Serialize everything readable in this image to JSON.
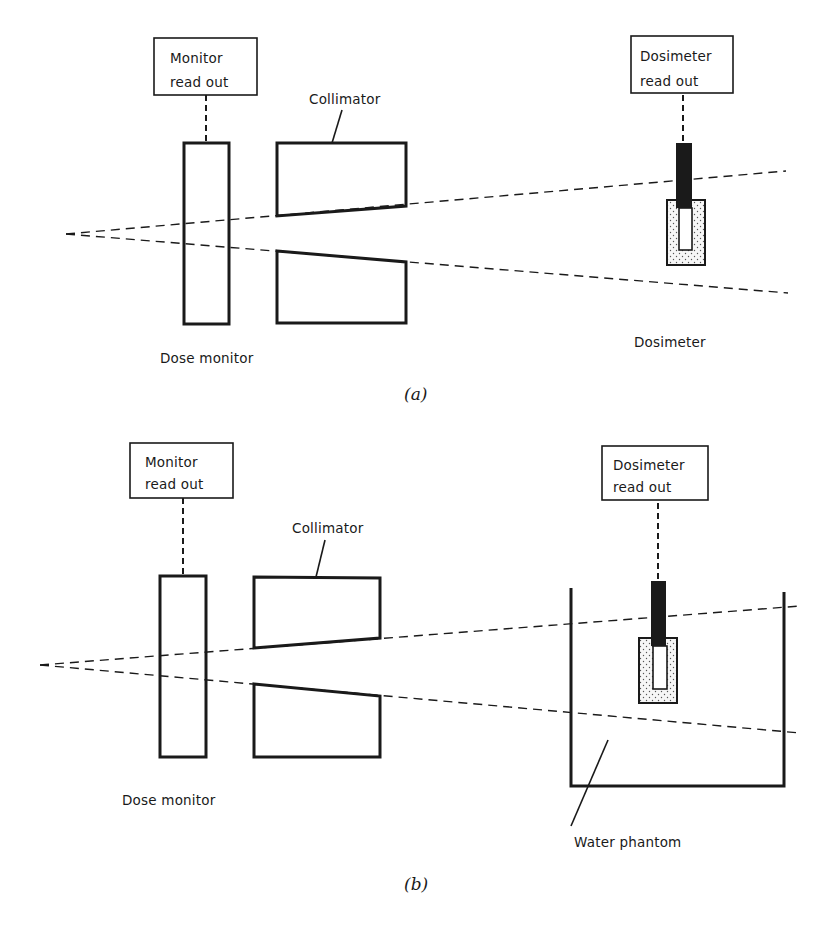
{
  "figure": {
    "panel_a": {
      "caption": "(a)",
      "monitor_readout": {
        "line1": "Monitor",
        "line2": "read out"
      },
      "collimator_label": "Collimator",
      "dose_monitor_label": "Dose monitor",
      "dosimeter_readout": {
        "line1": "Dosimeter",
        "line2": "read out"
      },
      "dosimeter_label": "Dosimeter"
    },
    "panel_b": {
      "caption": "(b)",
      "monitor_readout": {
        "line1": "Monitor",
        "line2": "read out"
      },
      "collimator_label": "Collimator",
      "dose_monitor_label": "Dose monitor",
      "dosimeter_readout": {
        "line1": "Dosimeter",
        "line2": "read out"
      },
      "water_phantom_label": "Water phantom"
    },
    "colors": {
      "ink": "#1a1a1a",
      "background": "#ffffff",
      "stipple": "#f2f2f2"
    }
  }
}
